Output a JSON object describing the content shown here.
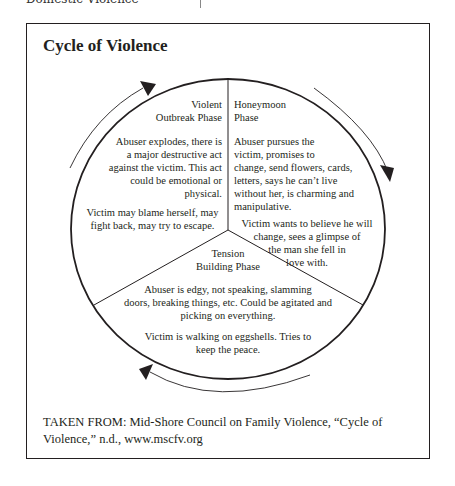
{
  "page": {
    "running_head": "Domestic Violence"
  },
  "figure": {
    "title": "Cycle of Violence",
    "source": "TAKEN FROM: Mid-Shore Council on Family Violence, “Cycle of Violence,” n.d., www.mscfv.org"
  },
  "phases": {
    "violent": {
      "title_line1": "Violent",
      "title_line2": "Outbreak Phase",
      "abuser_lines": [
        "Abuser explodes, there is",
        "a major destructive act",
        "against the victim. This act",
        "could be emotional or",
        "physical."
      ],
      "victim_lines": [
        "Victim may blame herself, may",
        "fight back, may try to escape."
      ]
    },
    "honeymoon": {
      "title_line1": "Honeymoon",
      "title_line2": "Phase",
      "abuser_lines": [
        "Abuser pursues the",
        "victim, promises to",
        "change, send flowers, cards,",
        "letters, says he can’t live",
        "without her, is charming and",
        "manipulative."
      ],
      "victim_lines": [
        "Victim wants to believe he will",
        "change, sees a glimpse of",
        "the man she fell in",
        "love with."
      ]
    },
    "tension": {
      "title_line1": "Tension",
      "title_line2": "Building Phase",
      "abuser_lines": [
        "Abuser is edgy, not speaking, slamming",
        "doors, breaking things, etc. Could be agitated and",
        "picking on everything."
      ],
      "victim_lines": [
        "Victim is walking on eggshells. Tries to",
        "keep the peace."
      ]
    }
  },
  "colors": {
    "ink": "#231f20",
    "background": "#ffffff"
  }
}
